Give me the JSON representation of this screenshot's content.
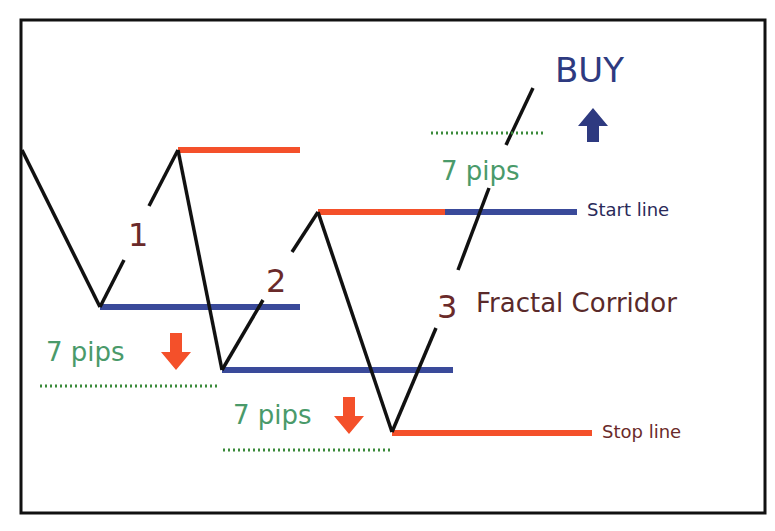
{
  "diagram": {
    "title": "Fractal Corridor",
    "labels": {
      "wave1": "1",
      "wave2": "2",
      "wave3": "3",
      "corridor": "Fractal Corridor",
      "buy": "BUY",
      "start_line": "Start line",
      "stop_line": "Stop line",
      "pips_top": "7 pips",
      "pips_left": "7 pips",
      "pips_bottom": "7 pips"
    },
    "colors": {
      "price_line": "#111111",
      "resistance": "#f4502a",
      "support": "#3a4a9a",
      "pips_text": "#4a9a6a",
      "pips_dotted": "#3a8a3a",
      "wave_number": "#6a2a2a",
      "buy_text": "#2e3a80",
      "border": "#111111"
    },
    "icons": {
      "buy_arrow": "arrow-up-icon",
      "sell_arrow_left": "arrow-down-icon",
      "sell_arrow_bottom": "arrow-down-icon"
    }
  }
}
